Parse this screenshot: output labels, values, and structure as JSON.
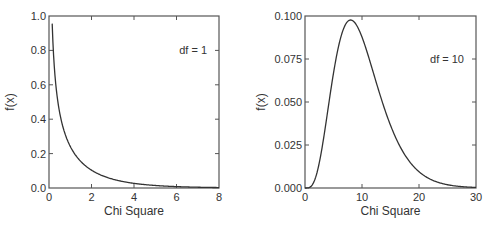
{
  "colors": {
    "background": "#ffffff",
    "frame": "#555555",
    "curve": "#333333",
    "text": "#333333"
  },
  "chart_data": [
    {
      "type": "line",
      "title": "",
      "annotation": "df = 1",
      "xlabel": "Chi Square",
      "ylabel": "f(x)",
      "xlim": [
        0,
        8
      ],
      "ylim": [
        0,
        1.0
      ],
      "xticks": [
        0,
        2,
        4,
        6,
        8
      ],
      "xtick_labels": [
        "0",
        "2",
        "4",
        "6",
        "8"
      ],
      "yticks": [
        0,
        0.2,
        0.4,
        0.6,
        0.8,
        1.0
      ],
      "ytick_labels": [
        "0.0",
        "0.2",
        "0.4",
        "0.6",
        "0.8",
        "1.0"
      ],
      "grid": false,
      "legend": null,
      "series": [
        {
          "name": "Chi-square pdf, df = 1",
          "x": [
            0.15,
            0.2,
            0.3,
            0.4,
            0.5,
            0.6,
            0.8,
            1.0,
            1.25,
            1.5,
            2.0,
            2.5,
            3.0,
            3.5,
            4.0,
            5.0,
            6.0,
            7.0,
            8.0
          ],
          "y": [
            0.93,
            0.81,
            0.627,
            0.516,
            0.439,
            0.381,
            0.297,
            0.242,
            0.189,
            0.154,
            0.104,
            0.073,
            0.051,
            0.037,
            0.027,
            0.015,
            0.008,
            0.005,
            0.003
          ]
        }
      ],
      "frame": {
        "x0": 49,
        "y0": 16,
        "x1": 219,
        "y1": 188
      }
    },
    {
      "type": "line",
      "title": "",
      "annotation": "df = 10",
      "xlabel": "Chi Square",
      "ylabel": "f(x)",
      "xlim": [
        0,
        30
      ],
      "ylim": [
        0,
        0.1
      ],
      "xticks": [
        0,
        10,
        20,
        30
      ],
      "xtick_labels": [
        "0",
        "10",
        "20",
        "30"
      ],
      "yticks": [
        0,
        0.025,
        0.05,
        0.075,
        0.1
      ],
      "ytick_labels": [
        "0.000",
        "0.025",
        "0.050",
        "0.075",
        "0.100"
      ],
      "grid": false,
      "legend": null,
      "series": [
        {
          "name": "Chi-square pdf, df = 10",
          "x": [
            0,
            0.5,
            1,
            1.5,
            2,
            3,
            4,
            5,
            6,
            7,
            8,
            9,
            10,
            11,
            12,
            13,
            14,
            15,
            16,
            17,
            18,
            19,
            20,
            22,
            24,
            26,
            28,
            30
          ],
          "y": [
            0,
            3e-05,
            0.00079,
            0.0042,
            0.0153,
            0.0353,
            0.0361,
            0.0668,
            0.084,
            0.0947,
            0.0977,
            0.0947,
            0.0877,
            0.0786,
            0.0688,
            0.0591,
            0.0499,
            0.0415,
            0.0341,
            0.0278,
            0.0224,
            0.0179,
            0.0142,
            0.0088,
            0.0054,
            0.0032,
            0.0019,
            0.0011
          ]
        }
      ],
      "frame": {
        "x0": 305,
        "y0": 16,
        "x1": 476,
        "y1": 188
      }
    }
  ]
}
